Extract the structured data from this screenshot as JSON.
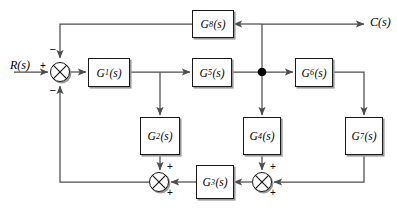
{
  "diagram": {
    "type": "block-diagram",
    "signals": {
      "input": "R(s)",
      "output": "C(s)"
    },
    "blocks": [
      {
        "id": "G1",
        "main": "G",
        "sub": "1",
        "tail": "(s)",
        "label": "G1(s)"
      },
      {
        "id": "G2",
        "main": "G",
        "sub": "2",
        "tail": "(s)",
        "label": "G2(s)"
      },
      {
        "id": "G3",
        "main": "G",
        "sub": "3",
        "tail": "(s)",
        "label": "G3(s)"
      },
      {
        "id": "G4",
        "main": "G",
        "sub": "4",
        "tail": "(s)",
        "label": "G4(s)"
      },
      {
        "id": "G5",
        "main": "G",
        "sub": "5",
        "tail": "(s)",
        "label": "G5(s)"
      },
      {
        "id": "G6",
        "main": "G",
        "sub": "6",
        "tail": "(s)",
        "label": "G6(s)"
      },
      {
        "id": "G7",
        "main": "G",
        "sub": "7",
        "tail": "(s)",
        "label": "G7(s)"
      },
      {
        "id": "G8",
        "main": "G",
        "sub": "8",
        "tail": "(s)",
        "label": "G8(s)"
      }
    ],
    "summing_junctions": [
      {
        "id": "sum-main",
        "signs": {
          "input": "+",
          "top": "–",
          "bottom": "–"
        }
      },
      {
        "id": "sum-left-bottom",
        "signs": {
          "top": "+",
          "bottom": "+"
        }
      },
      {
        "id": "sum-right-bottom",
        "signs": {
          "top": "+",
          "bottom": "+"
        }
      }
    ],
    "colors": {
      "line": "#4d4d4d",
      "block_border": "#1a1a1a",
      "shadow": "#9a9a9a",
      "node": "#000000",
      "background": "#ffffff"
    }
  }
}
